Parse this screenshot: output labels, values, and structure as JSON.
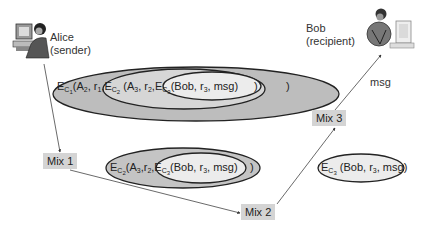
{
  "diagram": {
    "alice": {
      "icon": "person-at-computer-icon",
      "name": "Alice",
      "role": "(sender)"
    },
    "bob": {
      "icon": "person-at-computer-icon",
      "name": "Bob",
      "role": "(recipient)"
    },
    "mixes": [
      {
        "label": "Mix 1"
      },
      {
        "label": "Mix 2"
      },
      {
        "label": "Mix 3"
      }
    ],
    "edge_label": "msg",
    "onion_full": {
      "layer1": {
        "E": "E",
        "C": "C",
        "k": "1",
        "args": "(A",
        "a_sub": "2",
        "rest": ", r",
        "r_sub": "1",
        "sep": ",",
        "close": ")"
      },
      "layer2": {
        "E": "E",
        "C": "C",
        "k": "2",
        "args": " (A",
        "a_sub": "3",
        "rest": ", r",
        "r_sub": "2",
        "sep": ",",
        "close": ")"
      },
      "layer3": {
        "E": "E",
        "C": "C",
        "k": "3",
        "text": "(Bob, r",
        "r_sub": "3",
        "tail": ", msg)"
      }
    },
    "onion_after_mix1": {
      "layer2": {
        "E": "E",
        "C": "C",
        "k": "2",
        "args": "(A",
        "a_sub": "3",
        "rest": ",r",
        "r_sub": "2",
        "sep": ",",
        "close": ")"
      },
      "layer3": {
        "E": "E",
        "C": "C",
        "k": "3",
        "text": "(Bob, r",
        "r_sub": "3",
        "tail": ", msg)"
      }
    },
    "onion_after_mix2": {
      "layer3": {
        "E": "E",
        "C": "C",
        "k": "3",
        "text": " (Bob, r",
        "r_sub": "3",
        "tail": ", msg)"
      }
    },
    "colors": {
      "outer_layer": "#bdbdbd",
      "middle_layer": "#d6d6d6",
      "inner_layer": "#ececec",
      "mix_box": "#d4d4d4",
      "line": "#444444"
    }
  }
}
